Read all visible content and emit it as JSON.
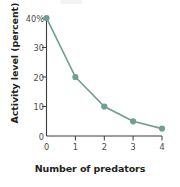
{
  "chart_data": {
    "type": "line",
    "title": "",
    "xlabel": "Number of predators",
    "ylabel": "Activity level (percent)",
    "x": [
      0,
      1,
      2,
      3,
      4
    ],
    "values": [
      40,
      20,
      10,
      5,
      2.5
    ],
    "xlim": [
      0,
      4
    ],
    "ylim": [
      0,
      40
    ],
    "xticks": [
      "0",
      "1",
      "2",
      "3",
      "4"
    ],
    "yticks": [
      "0",
      "10",
      "20",
      "30",
      "40%"
    ],
    "ytick_values": [
      0,
      10,
      20,
      30,
      40
    ],
    "grid": false,
    "legend": "none",
    "series_color": "#6f9e93",
    "marker": "circle",
    "axis_color": "#3c3c3c"
  },
  "labels": {
    "y_title": "Activity level (percent)",
    "x_title": "Number of predators",
    "y_tick_40": "40%",
    "y_tick_30": "30",
    "y_tick_20": "20",
    "y_tick_10": "10",
    "y_tick_0": "0",
    "x_tick_0": "0",
    "x_tick_1": "1",
    "x_tick_2": "2",
    "x_tick_3": "3",
    "x_tick_4": "4"
  }
}
